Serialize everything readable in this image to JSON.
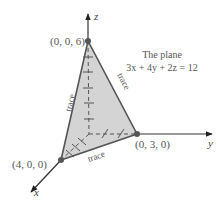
{
  "diagram": {
    "title_line1": "The plane",
    "title_line2": "3x + 4y + 2z = 12",
    "points": {
      "z_intercept": "(0, 0, 6)",
      "x_intercept": "(4, 0, 0)",
      "y_intercept": "(0, 3, 0)"
    },
    "axes": {
      "x": "x",
      "y": "y",
      "z": "z"
    },
    "trace_labels": [
      "trace",
      "trace",
      "trace"
    ],
    "colors": {
      "plane_fill": "#d4d4d4",
      "edge": "#555555",
      "axis": "#444444",
      "point": "#555555",
      "text": "#555555"
    }
  }
}
